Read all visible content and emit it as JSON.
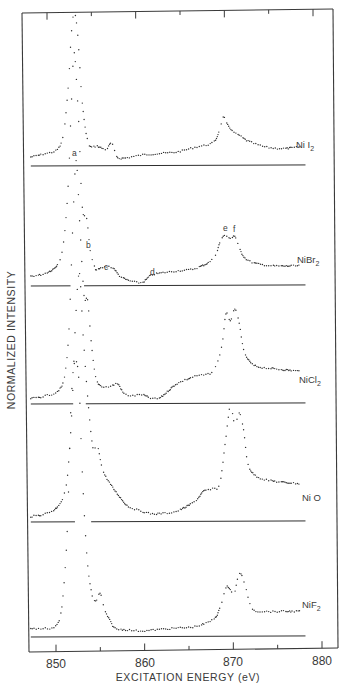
{
  "chart_data": {
    "type": "line",
    "title": "",
    "xlabel": "EXCITATION ENERGY (eV)",
    "ylabel": "NORMALIZED INTENSITY",
    "xlim": [
      847.5,
      881.5
    ],
    "x_ticks_major": [
      850,
      860,
      870,
      880
    ],
    "x_ticks_minor": [
      855,
      865,
      875
    ],
    "x_tick_labels": [
      "850",
      "860",
      "870",
      "880"
    ],
    "grid": false,
    "legend": "none (labels placed at right end of each trace)",
    "layout": "stacked, vertically offset spectra each with own baseline",
    "series": [
      {
        "name": "NiI2",
        "label_main": "Ni I",
        "label_sub": "2",
        "style": "dotted",
        "baseline_y_px": 166,
        "scale_px": 150,
        "baseline_from": 847.5,
        "baseline_to": 877.8,
        "x": [
          847.5,
          849,
          850.5,
          851.2,
          851.7,
          852.1,
          852.4,
          852.8,
          853.3,
          854,
          855,
          856,
          856.6,
          857.2,
          858,
          860,
          862,
          864,
          866,
          868,
          868.7,
          869.2,
          869.6,
          870.2,
          871,
          872,
          874,
          876,
          877.8
        ],
        "values": [
          0.04,
          0.06,
          0.09,
          0.2,
          0.5,
          0.88,
          1.0,
          0.85,
          0.4,
          0.13,
          0.11,
          0.09,
          0.13,
          0.04,
          0.03,
          0.05,
          0.06,
          0.07,
          0.1,
          0.13,
          0.2,
          0.3,
          0.26,
          0.21,
          0.18,
          0.14,
          0.1,
          0.09,
          0.1
        ]
      },
      {
        "name": "NiBr2",
        "label_main": "NiBr",
        "label_sub": "2",
        "style": "dotted",
        "baseline_y_px": 286,
        "scale_px": 230,
        "baseline_segments": [
          [
            847.5,
            851.3
          ],
          [
            853.5,
            877.8
          ]
        ],
        "x": [
          847.5,
          849,
          850.5,
          851.2,
          851.7,
          852.1,
          852.4,
          852.9,
          853.3,
          853.8,
          854.2,
          854.8,
          855.5,
          856.3,
          856.9,
          857.5,
          858.5,
          860,
          861,
          862,
          864,
          866,
          868,
          868.8,
          869.2,
          869.6,
          870.1,
          870.5,
          871.1,
          871.8,
          873,
          875,
          877.8
        ],
        "values": [
          0.03,
          0.04,
          0.08,
          0.18,
          0.42,
          0.8,
          1.0,
          0.7,
          0.33,
          0.28,
          0.14,
          0.06,
          0.065,
          0.07,
          0.06,
          0.03,
          0.01,
          0.0,
          0.03,
          0.04,
          0.05,
          0.06,
          0.1,
          0.17,
          0.2,
          0.2,
          0.19,
          0.2,
          0.14,
          0.1,
          0.08,
          0.07,
          0.07
        ]
      },
      {
        "name": "NiCl2",
        "label_main": "NiCl",
        "label_sub": "2",
        "style": "dotted",
        "baseline_y_px": 404,
        "scale_px": 240,
        "baseline_segments": [
          [
            847.5,
            851.6
          ],
          [
            853.7,
            877.8
          ]
        ],
        "x": [
          847.5,
          849,
          850.5,
          851.3,
          851.8,
          852.2,
          852.6,
          853,
          853.5,
          853.9,
          854.3,
          854.8,
          855.5,
          856.5,
          857.3,
          858,
          859,
          860,
          861,
          862,
          863,
          864,
          866,
          868,
          869,
          869.5,
          870,
          870.5,
          871,
          871.5,
          872.2,
          873,
          875,
          877.8
        ],
        "values": [
          0.01,
          0.02,
          0.04,
          0.1,
          0.3,
          0.7,
          1.0,
          0.75,
          0.44,
          0.42,
          0.25,
          0.1,
          0.06,
          0.06,
          0.07,
          0.03,
          0.02,
          0.025,
          0.01,
          0.01,
          0.04,
          0.07,
          0.1,
          0.12,
          0.22,
          0.36,
          0.33,
          0.38,
          0.32,
          0.21,
          0.16,
          0.14,
          0.13,
          0.12
        ]
      },
      {
        "name": "NiO",
        "label_main": "Ni O",
        "label_sub": "",
        "style": "dotted",
        "baseline_y_px": 522,
        "scale_px": 245,
        "baseline_segments": [
          [
            847.5,
            851.8
          ],
          [
            854.3,
            877.8
          ]
        ],
        "x": [
          847.5,
          849,
          850.5,
          851.5,
          852.1,
          852.6,
          853,
          853.4,
          853.9,
          854.5,
          855,
          855.6,
          856.5,
          857.5,
          858.5,
          860,
          861,
          862,
          864,
          866,
          867,
          868,
          868.8,
          869.4,
          870,
          870.5,
          871,
          871.5,
          872,
          873,
          875,
          877.8
        ],
        "values": [
          0.01,
          0.02,
          0.05,
          0.14,
          0.42,
          0.85,
          1.0,
          0.75,
          0.5,
          0.29,
          0.3,
          0.2,
          0.14,
          0.09,
          0.05,
          0.03,
          0.02,
          0.02,
          0.03,
          0.07,
          0.11,
          0.12,
          0.14,
          0.3,
          0.46,
          0.38,
          0.43,
          0.36,
          0.22,
          0.17,
          0.15,
          0.14
        ]
      },
      {
        "name": "NiF2",
        "label_main": "NiF",
        "label_sub": "2",
        "style": "dotted",
        "baseline_y_px": 637,
        "scale_px": 270,
        "baseline_from": 847.5,
        "baseline_to": 877.8,
        "x": [
          847.5,
          849,
          850.3,
          851,
          851.6,
          852,
          852.4,
          852.9,
          853.3,
          853.8,
          854.3,
          854.8,
          855.3,
          855.8,
          856.4,
          857,
          858,
          860,
          862,
          864,
          866,
          868,
          868.8,
          869.5,
          870,
          870.4,
          870.8,
          871.2,
          871.8,
          872.5,
          874,
          876,
          877.8
        ],
        "values": [
          0.02,
          0.02,
          0.03,
          0.1,
          0.38,
          0.82,
          1.0,
          0.95,
          0.6,
          0.3,
          0.16,
          0.12,
          0.15,
          0.09,
          0.05,
          0.02,
          0.015,
          0.01,
          0.015,
          0.02,
          0.025,
          0.05,
          0.09,
          0.17,
          0.16,
          0.14,
          0.2,
          0.22,
          0.16,
          0.09,
          0.08,
          0.08,
          0.08
        ]
      }
    ],
    "annotations": [
      {
        "text": "a",
        "series": "NiI2",
        "x_eV": 851.3,
        "y_px": 156
      },
      {
        "text": "b",
        "series": "NiBr2",
        "x_eV": 854.2,
        "y_px": 247
      },
      {
        "text": "c",
        "series": "NiBr2",
        "x_eV": 856.0,
        "y_px": 270
      },
      {
        "text": "d",
        "series": "NiBr2",
        "x_eV": 861.0,
        "y_px": 275
      },
      {
        "text": "e",
        "series": "NiBr2",
        "x_eV": 869.2,
        "y_px": 231
      },
      {
        "text": "f",
        "series": "NiBr2",
        "x_eV": 870.4,
        "y_px": 232
      }
    ]
  },
  "axes": {
    "x_title": "EXCITATION ENERGY (eV)",
    "y_title": "NORMALIZED INTENSITY",
    "tick_labels": [
      "850",
      "860",
      "870",
      "880"
    ]
  },
  "series_labels": {
    "NiI2": {
      "main": "Ni I",
      "sub": "2"
    },
    "NiBr2": {
      "main": "NiBr",
      "sub": "2"
    },
    "NiCl2": {
      "main": "NiCl",
      "sub": "2"
    },
    "NiO": {
      "main": "Ni O",
      "sub": ""
    },
    "NiF2": {
      "main": "NiF",
      "sub": "2"
    }
  },
  "peak_labels": [
    "a",
    "b",
    "c",
    "d",
    "e",
    "f"
  ],
  "colors": {
    "ink": "#2e2e2e",
    "frame": "#3a3a3a",
    "paper": "#ffffff"
  }
}
